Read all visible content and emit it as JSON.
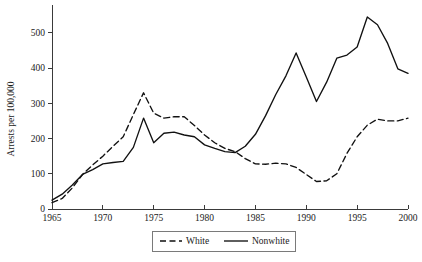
{
  "chart_data": {
    "type": "line",
    "title": "",
    "xlabel": "",
    "ylabel": "Arrests per 100,000",
    "xlim": [
      1965,
      2000
    ],
    "ylim": [
      0,
      545
    ],
    "grid": false,
    "legend_position": "bottom-center",
    "x": [
      1965,
      1966,
      1967,
      1968,
      1969,
      1970,
      1971,
      1972,
      1973,
      1974,
      1975,
      1976,
      1977,
      1978,
      1979,
      1980,
      1981,
      1982,
      1983,
      1984,
      1985,
      1986,
      1987,
      1988,
      1989,
      1990,
      1991,
      1992,
      1993,
      1994,
      1995,
      1996,
      1997,
      1998,
      1999,
      2000
    ],
    "y_ticks": [
      0,
      100,
      200,
      300,
      400,
      500
    ],
    "x_ticks": [
      1965,
      1970,
      1975,
      1980,
      1985,
      1990,
      1995,
      2000
    ],
    "y_tick_labels": [
      "0",
      "100",
      "200",
      "300",
      "400",
      "500"
    ],
    "x_tick_labels": [
      "1965",
      "1970",
      "1975",
      "1980",
      "1985",
      "1990",
      "1995",
      "2000"
    ],
    "series": [
      {
        "name": "White",
        "style": "dashed",
        "color": "#111111",
        "values": [
          18,
          30,
          60,
          98,
          125,
          150,
          178,
          205,
          268,
          330,
          272,
          258,
          262,
          262,
          237,
          210,
          188,
          172,
          163,
          143,
          128,
          127,
          130,
          128,
          118,
          98,
          78,
          80,
          100,
          158,
          205,
          238,
          255,
          250,
          250,
          258
        ]
      },
      {
        "name": "Nonwhite",
        "style": "solid",
        "color": "#111111",
        "values": [
          25,
          42,
          68,
          98,
          112,
          128,
          132,
          135,
          175,
          258,
          188,
          215,
          218,
          210,
          205,
          182,
          172,
          163,
          160,
          178,
          212,
          265,
          325,
          378,
          443,
          375,
          305,
          360,
          428,
          437,
          460,
          545,
          523,
          470,
          398,
          385
        ]
      }
    ]
  },
  "legend": {
    "items": [
      {
        "label": "White",
        "style": "dashed"
      },
      {
        "label": "Nonwhite",
        "style": "solid"
      }
    ]
  }
}
